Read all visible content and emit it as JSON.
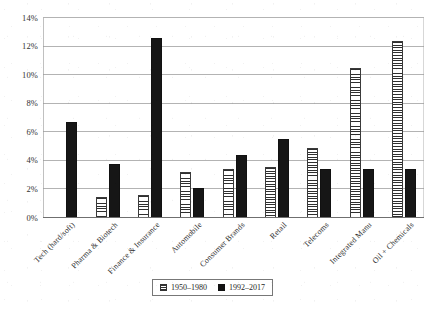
{
  "chart_data": {
    "type": "bar",
    "title": "",
    "xlabel": "",
    "ylabel": "",
    "ylim": [
      0,
      14
    ],
    "ytick_labels": [
      "0%",
      "2%",
      "4%",
      "6%",
      "8%",
      "10%",
      "12%",
      "14%"
    ],
    "ytick_values": [
      0,
      2,
      4,
      6,
      8,
      10,
      12,
      14
    ],
    "grid": true,
    "legend_position": "bottom-center",
    "categories": [
      "Tech (hard/soft)",
      "Pharma & Biotech",
      "Finance & Insurance",
      "Automobile",
      "Consumer Brands",
      "Retail",
      "Telecoms",
      "Integrated Manu",
      "Oil + Chemicals"
    ],
    "series": [
      {
        "name": "1950–1980",
        "style": "hatched",
        "values": [
          0,
          1.5,
          1.6,
          3.2,
          3.4,
          3.6,
          4.9,
          10.5,
          12.4
        ]
      },
      {
        "name": "1992–2017",
        "style": "solid-black",
        "values": [
          6.7,
          3.8,
          12.6,
          2.1,
          4.4,
          5.5,
          3.4,
          3.4,
          3.4
        ]
      }
    ]
  },
  "legend": {
    "items": [
      {
        "label": "1950–1980",
        "swatch": "hatched-swatch-icon"
      },
      {
        "label": "1992–2017",
        "swatch": "solid-swatch-icon"
      }
    ]
  }
}
